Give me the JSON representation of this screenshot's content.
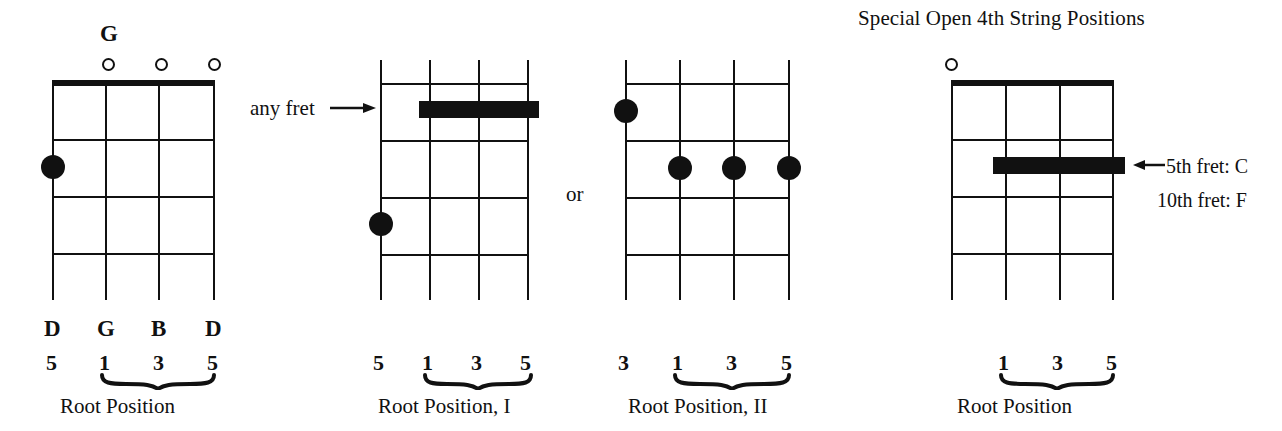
{
  "page": {
    "width": 1282,
    "height": 431,
    "background": "#ffffff",
    "ink": "#111111"
  },
  "heading": {
    "text": "Special Open 4th String Positions"
  },
  "annotations": {
    "any_fret": "any fret",
    "or": "or",
    "fret5": "5th fret: C",
    "fret10": "10th fret: F"
  },
  "diagrams": [
    {
      "id": "g-chord-open",
      "chord_name": "G",
      "has_nut": true,
      "strings": 4,
      "frets": 4,
      "open_strings": [
        2,
        3,
        4
      ],
      "dots": [
        {
          "string": 1,
          "fret": 2
        }
      ],
      "barres": [],
      "note_labels": [
        "D",
        "G",
        "B",
        "D"
      ],
      "degree_labels": [
        "5",
        "1",
        "3",
        "5"
      ],
      "brace_span": [
        2,
        4
      ],
      "caption": "Root Position"
    },
    {
      "id": "root-position-I",
      "chord_name": "",
      "has_nut": false,
      "strings": 4,
      "frets": 4,
      "open_strings": [],
      "dots": [
        {
          "string": 1,
          "fret": 4
        }
      ],
      "barres": [
        {
          "from_string": 2,
          "to_string": 4,
          "fret": 2
        }
      ],
      "note_labels": [
        "",
        "",
        "",
        ""
      ],
      "degree_labels": [
        "5",
        "1",
        "3",
        "5"
      ],
      "brace_span": [
        2,
        4
      ],
      "caption": "Root Position, I"
    },
    {
      "id": "root-position-II",
      "chord_name": "",
      "has_nut": false,
      "strings": 4,
      "frets": 4,
      "open_strings": [],
      "dots": [
        {
          "string": 1,
          "fret": 1
        },
        {
          "string": 2,
          "fret": 2
        },
        {
          "string": 3,
          "fret": 2
        },
        {
          "string": 4,
          "fret": 2
        }
      ],
      "barres": [],
      "note_labels": [
        "",
        "",
        "",
        ""
      ],
      "degree_labels": [
        "3",
        "1",
        "3",
        "5"
      ],
      "brace_span": [
        2,
        4
      ],
      "caption": "Root Position, II"
    },
    {
      "id": "special-open-4th",
      "chord_name": "",
      "has_nut": true,
      "strings": 4,
      "frets": 4,
      "open_strings": [
        1
      ],
      "dots": [],
      "barres": [
        {
          "from_string": 2,
          "to_string": 4,
          "fret": 2
        }
      ],
      "note_labels": [
        "",
        "",
        "",
        ""
      ],
      "degree_labels": [
        "",
        "1",
        "3",
        "5"
      ],
      "brace_span": [
        2,
        4
      ],
      "caption": "Root Position"
    }
  ]
}
